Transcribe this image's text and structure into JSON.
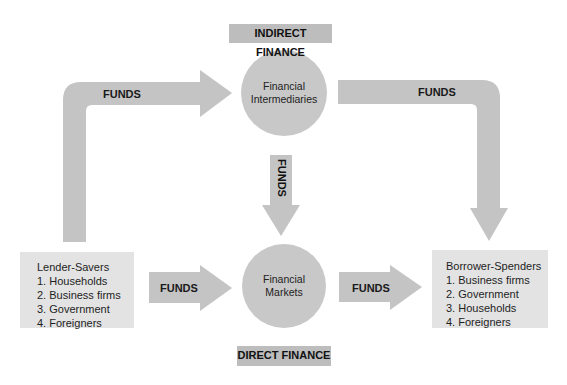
{
  "colors": {
    "arrow": "#c4c4c4",
    "circle": "#c8c8c8",
    "tag": "#bdbdbd",
    "box": "#e3e3e3",
    "text": "#1a1a1a"
  },
  "labels": {
    "indirect_finance": "INDIRECT FINANCE",
    "direct_finance": "DIRECT FINANCE"
  },
  "nodes": {
    "intermediaries": {
      "line1": "Financial",
      "line2": "Intermediaries"
    },
    "markets": {
      "line1": "Financial",
      "line2": "Markets"
    },
    "lenders": {
      "title": "Lender-Savers",
      "items": [
        "1. Households",
        "2. Business firms",
        "3. Government",
        "4. Foreigners"
      ]
    },
    "borrowers": {
      "title": "Borrower-Spenders",
      "items": [
        "1. Business firms",
        "2. Government",
        "3. Households",
        "4. Foreigners"
      ]
    }
  },
  "arrows": {
    "lenders_to_intermediaries": "FUNDS",
    "intermediaries_to_borrowers": "FUNDS",
    "intermediaries_to_markets": "FUNDS",
    "lenders_to_markets": "FUNDS",
    "markets_to_borrowers": "FUNDS"
  }
}
